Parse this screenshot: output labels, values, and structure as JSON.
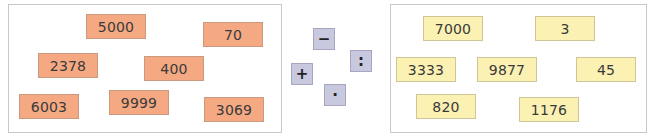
{
  "left_group": {
    "color": "#f4a983",
    "cards": [
      {
        "value": "5000",
        "x": 86,
        "y": 14,
        "w": 60,
        "h": 25
      },
      {
        "value": "70",
        "x": 203,
        "y": 22,
        "w": 60,
        "h": 25
      },
      {
        "value": "2378",
        "x": 38,
        "y": 53,
        "w": 60,
        "h": 25
      },
      {
        "value": "400",
        "x": 144,
        "y": 56,
        "w": 60,
        "h": 25
      },
      {
        "value": "6003",
        "x": 19,
        "y": 94,
        "w": 60,
        "h": 25
      },
      {
        "value": "9999",
        "x": 109,
        "y": 90,
        "w": 60,
        "h": 25
      },
      {
        "value": "3069",
        "x": 204,
        "y": 97,
        "w": 60,
        "h": 25
      }
    ]
  },
  "operators": [
    {
      "symbol": "−",
      "name": "minus",
      "x": 313,
      "y": 28
    },
    {
      "symbol": ":",
      "name": "divide",
      "x": 350,
      "y": 50
    },
    {
      "symbol": "+",
      "name": "plus",
      "x": 291,
      "y": 63
    },
    {
      "symbol": "·",
      "name": "multiply",
      "x": 324,
      "y": 84
    }
  ],
  "right_group": {
    "color": "#fbf1b2",
    "cards": [
      {
        "value": "7000",
        "x": 423,
        "y": 16,
        "w": 60,
        "h": 25
      },
      {
        "value": "3",
        "x": 535,
        "y": 16,
        "w": 60,
        "h": 25
      },
      {
        "value": "3333",
        "x": 396,
        "y": 57,
        "w": 60,
        "h": 25
      },
      {
        "value": "9877",
        "x": 477,
        "y": 57,
        "w": 60,
        "h": 25
      },
      {
        "value": "45",
        "x": 576,
        "y": 57,
        "w": 60,
        "h": 25
      },
      {
        "value": "820",
        "x": 416,
        "y": 94,
        "w": 60,
        "h": 25
      },
      {
        "value": "1176",
        "x": 519,
        "y": 97,
        "w": 60,
        "h": 25
      }
    ]
  }
}
